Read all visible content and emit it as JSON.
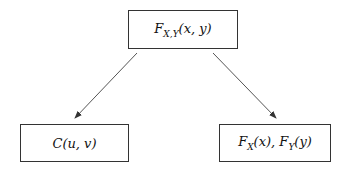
{
  "diagram": {
    "nodes": [
      {
        "id": "joint",
        "label": "F_{X,Y}(x, y)",
        "display": {
          "main": "F",
          "sub": "X,Y",
          "args": "(x, y)"
        }
      },
      {
        "id": "copula",
        "label": "C(u, v)",
        "display": {
          "main": "C(u, v)"
        }
      },
      {
        "id": "marginals",
        "label": "F_X(x), F_Y(y)",
        "display": {
          "f1": "F",
          "s1": "X",
          "a1": "(x), ",
          "f2": "F",
          "s2": "Y",
          "a2": "(y)"
        }
      }
    ],
    "edges": [
      {
        "from": "joint",
        "to": "copula"
      },
      {
        "from": "joint",
        "to": "marginals"
      }
    ],
    "colors": {
      "line": "#333333",
      "text": "#111111",
      "background": "#ffffff"
    }
  }
}
